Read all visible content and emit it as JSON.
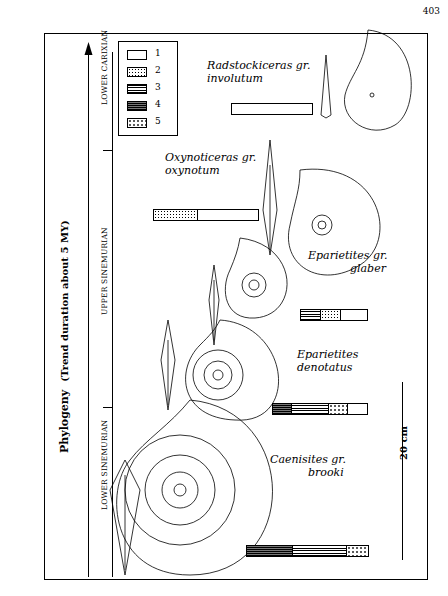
{
  "page_number": "403",
  "axis": {
    "title": "Phylogeny",
    "subtitle": "(Trend duration about 5 MY)",
    "stages": [
      "LOWER SINEMURIAN",
      "UPPER SINEMURIAN",
      "LOWER CARIXIAN"
    ]
  },
  "legend": {
    "items": [
      {
        "num": "1",
        "pattern": "blank"
      },
      {
        "num": "2",
        "pattern": "fine-dots"
      },
      {
        "num": "3",
        "pattern": "horizontal-lines"
      },
      {
        "num": "4",
        "pattern": "dense-lines"
      },
      {
        "num": "5",
        "pattern": "sparse-dots"
      }
    ]
  },
  "species": [
    {
      "name_line1": "Radstockiceras gr.",
      "name_line2": "involutum",
      "bar": [
        {
          "pattern": "blank",
          "width": 100
        }
      ]
    },
    {
      "name_line1": "Oxynoticeras gr.",
      "name_line2": "oxynotum",
      "bar": [
        {
          "pattern": "fine-dots",
          "width": 42
        },
        {
          "pattern": "blank",
          "width": 58
        }
      ]
    },
    {
      "name_line1": "Eparietites gr.",
      "name_line2": "glaber",
      "bar": [
        {
          "pattern": "horizontal-lines",
          "width": 30
        },
        {
          "pattern": "fine-dots",
          "width": 30
        },
        {
          "pattern": "blank",
          "width": 40
        }
      ]
    },
    {
      "name_line1": "Eparietites",
      "name_line2": "denotatus",
      "bar": [
        {
          "pattern": "dense-lines",
          "width": 20
        },
        {
          "pattern": "horizontal-lines",
          "width": 40
        },
        {
          "pattern": "sparse-dots",
          "width": 20
        },
        {
          "pattern": "blank",
          "width": 20
        }
      ]
    },
    {
      "name_line1": "Caenisites gr.",
      "name_line2": "brooki",
      "bar": [
        {
          "pattern": "dense-lines",
          "width": 38
        },
        {
          "pattern": "horizontal-lines",
          "width": 45
        },
        {
          "pattern": "sparse-dots",
          "width": 17
        }
      ]
    }
  ],
  "scale": {
    "label": "20 cm"
  }
}
